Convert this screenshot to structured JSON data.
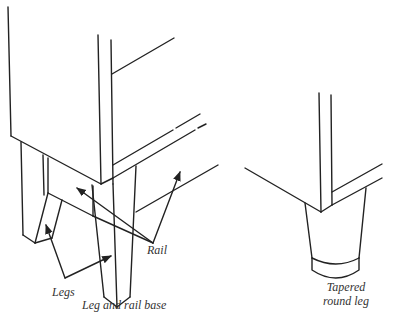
{
  "figures": [
    {
      "id": "leg-and-rail-base",
      "caption": "Leg and rail base",
      "callouts": [
        "Legs",
        "Rail"
      ]
    },
    {
      "id": "tapered-round-leg",
      "caption_lines": [
        "Tapered",
        "round leg"
      ]
    }
  ],
  "labels": {
    "legs": "Legs",
    "rail": "Rail",
    "leg_and_rail_base": "Leg and rail base",
    "tapered_line1": "Tapered",
    "tapered_line2": "round leg"
  },
  "colors": {
    "line": "#222222",
    "background": "#ffffff"
  }
}
